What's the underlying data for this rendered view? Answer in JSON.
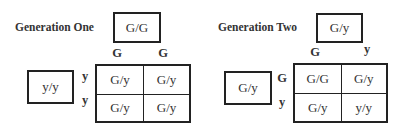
{
  "generation_one": {
    "title": "Generation One",
    "parent_top": "G/G",
    "parent_left": "y/y",
    "column_alleles": [
      "G",
      "G"
    ],
    "row_alleles": [
      "y",
      "y"
    ],
    "cells": [
      [
        "G/y",
        "G/y"
      ],
      [
        "G/y",
        "G/y"
      ]
    ]
  },
  "generation_two": {
    "title": "Generation Two",
    "parent_top": "G/y",
    "parent_left": "G/y",
    "column_alleles": [
      "G",
      "y"
    ],
    "row_alleles": [
      "G",
      "y"
    ],
    "cells": [
      [
        "G/G",
        "G/y"
      ],
      [
        "G/y",
        "y/y"
      ]
    ]
  }
}
